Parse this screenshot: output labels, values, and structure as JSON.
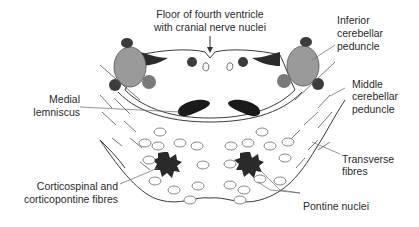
{
  "labels": {
    "floor_line1": "Floor of fourth ventricle",
    "floor_line2": "with cranial nerve nuclei",
    "icp_line1": "Inferior",
    "icp_line2": "cerebellar",
    "icp_line3": "peduncle",
    "mcp_line1": "Middle",
    "mcp_line2": "cerebellar",
    "mcp_line3": "peduncle",
    "ml_line1": "Medial",
    "ml_line2": "lemniscus",
    "tf_line1": "Transverse",
    "tf_line2": "fibres",
    "cs_line1": "Corticospinal and",
    "cs_line2": "corticopontine fibres",
    "pn_line1": "Pontine nuclei"
  },
  "colors": {
    "outline": "#3a3a3a",
    "peduncle_fill": "#9a9a9a",
    "dark_nucleus": "#3c3c3c",
    "mid_nucleus": "#7a7a7a",
    "black_structure": "#1a1a1a",
    "background": "#ffffff"
  }
}
